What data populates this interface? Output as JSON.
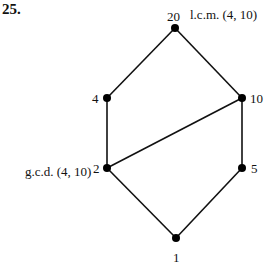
{
  "problem_number": "25.",
  "diagram": {
    "type": "hasse-diagram",
    "nodes": [
      {
        "id": "n20",
        "label": "20",
        "x": 175,
        "y": 28
      },
      {
        "id": "n4",
        "label": "4",
        "x": 107,
        "y": 98
      },
      {
        "id": "n10",
        "label": "10",
        "x": 242,
        "y": 98
      },
      {
        "id": "n2",
        "label": "2",
        "x": 107,
        "y": 168
      },
      {
        "id": "n5",
        "label": "5",
        "x": 242,
        "y": 168
      },
      {
        "id": "n1",
        "label": "1",
        "x": 176,
        "y": 238
      }
    ],
    "edges": [
      [
        "n20",
        "n4"
      ],
      [
        "n20",
        "n10"
      ],
      [
        "n4",
        "n2"
      ],
      [
        "n2",
        "n10"
      ],
      [
        "n10",
        "n5"
      ],
      [
        "n2",
        "n1"
      ],
      [
        "n5",
        "n1"
      ]
    ],
    "annotations": {
      "lcm": "l.c.m. (4, 10)",
      "gcd": "g.c.d. (4, 10)"
    }
  },
  "colors": {
    "line": "#111111",
    "node": "#000000",
    "background": "#ffffff"
  }
}
